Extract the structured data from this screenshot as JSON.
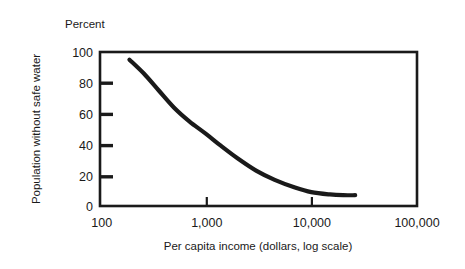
{
  "figure": {
    "unit_label": "Percent",
    "background_color": "#ffffff",
    "ink_color": "#1a1a1a"
  },
  "chart_data": {
    "type": "line",
    "title": "",
    "subtitle": "",
    "unit_label": "Percent",
    "xlabel": "Per capita income (dollars, log scale)",
    "ylabel": "Population without safe water",
    "xscale": "log",
    "yscale": "linear",
    "xlim": [
      100,
      100000
    ],
    "ylim": [
      0,
      100
    ],
    "grid": false,
    "legend": false,
    "legend_position": "none",
    "x_tick_labels": [
      "100",
      "1,000",
      "10,000",
      "100,000"
    ],
    "x_tick_values": [
      100,
      1000,
      10000,
      100000
    ],
    "y_tick_labels": [
      "0",
      "20",
      "40",
      "60",
      "80",
      "100"
    ],
    "y_tick_values": [
      0,
      20,
      40,
      60,
      80,
      100
    ],
    "series": [
      {
        "name": "Population without safe water",
        "color": "#1a1a1a",
        "line_width": 4.2,
        "x": [
          190,
          260,
          360,
          500,
          700,
          1000,
          1400,
          2000,
          3000,
          4500,
          7000,
          10000,
          15000,
          20000,
          26000
        ],
        "values": [
          95,
          86,
          75,
          64,
          55,
          47,
          39,
          31,
          23,
          17,
          12,
          9,
          7.5,
          7,
          7
        ]
      }
    ],
    "annotations": []
  },
  "axes": {
    "y_axis_tick_direction": "inward",
    "x_axis_tick_direction": "upward",
    "frame": "full-box"
  }
}
